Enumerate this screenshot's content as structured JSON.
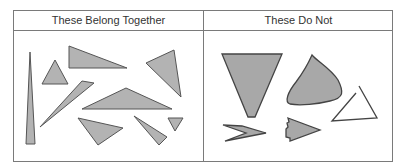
{
  "table": {
    "columns": [
      {
        "label": "These Belong Together",
        "contents": "nine gray-filled triangles of varied size and orientation"
      },
      {
        "label": "These Do Not",
        "contents": "five non-triangle / non-matching shapes: inverted trapezoid, curved blob, open triangle outline, chevron, notched arrow"
      }
    ]
  },
  "colors": {
    "fill": "#b3b3b3",
    "stroke": "#555555",
    "border": "#7a7a7a"
  }
}
